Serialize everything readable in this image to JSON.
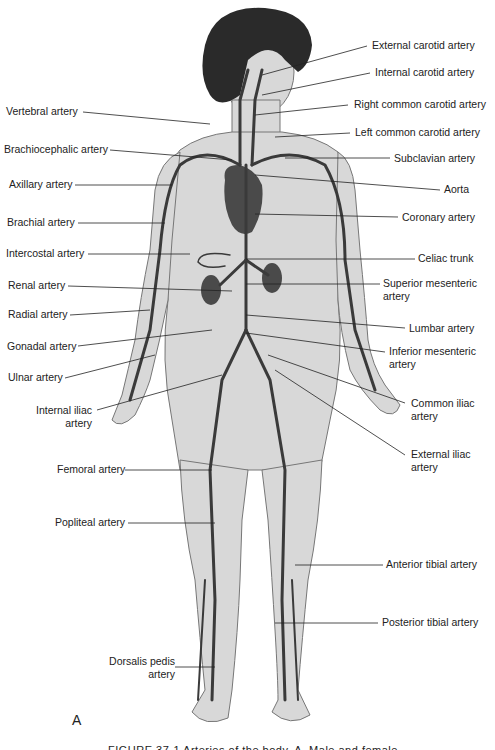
{
  "figure": {
    "panel_letter": "A",
    "caption_partial": "FIGURE 37-1 Arteries of the body, A. Male and female",
    "colors": {
      "skin": "#d8d8d8",
      "skin_outline": "#777777",
      "artery": "#3a3a3a",
      "hair": "#2a2a2a",
      "organ": "#4a4a4a",
      "leader_line": "#222222",
      "text": "#222222"
    }
  },
  "labels_left": [
    {
      "id": "vertebral",
      "text": "Vertebral artery"
    },
    {
      "id": "brachiocephalic",
      "text": "Brachiocephalic artery"
    },
    {
      "id": "axillary",
      "text": "Axillary artery"
    },
    {
      "id": "brachial",
      "text": "Brachial artery"
    },
    {
      "id": "intercostal",
      "text": "Intercostal artery"
    },
    {
      "id": "renal",
      "text": "Renal artery"
    },
    {
      "id": "radial",
      "text": "Radial artery"
    },
    {
      "id": "gonadal",
      "text": "Gonadal artery"
    },
    {
      "id": "ulnar",
      "text": "Ulnar artery"
    },
    {
      "id": "internal_iliac",
      "text": "Internal iliac artery"
    },
    {
      "id": "femoral",
      "text": "Femoral artery"
    },
    {
      "id": "popliteal",
      "text": "Popliteal artery"
    },
    {
      "id": "dorsalis_pedis",
      "text": "Dorsalis pedis artery"
    }
  ],
  "labels_right": [
    {
      "id": "external_carotid",
      "text": "External carotid artery"
    },
    {
      "id": "internal_carotid",
      "text": "Internal carotid artery"
    },
    {
      "id": "right_common_carotid",
      "text": "Right common carotid artery"
    },
    {
      "id": "left_common_carotid",
      "text": "Left common carotid artery"
    },
    {
      "id": "subclavian",
      "text": "Subclavian artery"
    },
    {
      "id": "aorta",
      "text": "Aorta"
    },
    {
      "id": "coronary",
      "text": "Coronary artery"
    },
    {
      "id": "celiac",
      "text": "Celiac trunk"
    },
    {
      "id": "superior_mesenteric",
      "text": "Superior mesenteric artery"
    },
    {
      "id": "lumbar",
      "text": "Lumbar artery"
    },
    {
      "id": "inferior_mesenteric",
      "text": "Inferior mesenteric artery"
    },
    {
      "id": "common_iliac",
      "text": "Common iliac artery"
    },
    {
      "id": "external_iliac",
      "text": "External iliac artery"
    },
    {
      "id": "anterior_tibial",
      "text": "Anterior tibial artery"
    },
    {
      "id": "posterior_tibial",
      "text": "Posterior tibial artery"
    }
  ]
}
